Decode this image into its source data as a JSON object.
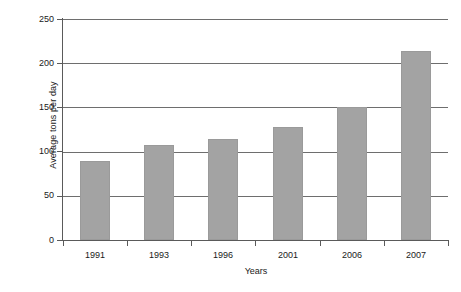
{
  "chart_data": {
    "type": "bar",
    "title": "",
    "xlabel": "Years",
    "ylabel": "Average tons per day",
    "categories": [
      "1991",
      "1993",
      "1996",
      "2001",
      "2006",
      "2007"
    ],
    "values": [
      89,
      107,
      114,
      128,
      150,
      214
    ],
    "ylim": [
      0,
      250
    ],
    "y_ticks": [
      0,
      50,
      100,
      150,
      200,
      250
    ],
    "y_tick_labels": [
      "0",
      "50",
      "100",
      "150",
      "200",
      "250"
    ],
    "grid": true,
    "legend": "none",
    "bar_color": "#a3a3a3",
    "axis_color": "#5a5a5a",
    "gridline_color": "#6e6e6e",
    "background_color": "#ffffff",
    "text_color": "#1a1a1a"
  }
}
